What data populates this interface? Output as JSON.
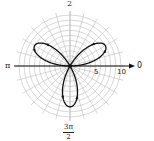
{
  "chart_data": {
    "type": "polar",
    "title": "",
    "equation_form": "rose curve with three petals",
    "petal_directions_rad": [
      "π/6",
      "5π/6",
      "3π/2"
    ],
    "petal_directions_deg": [
      30,
      150,
      270
    ],
    "petal_length": 8,
    "axis_labels": {
      "angle_0": "0",
      "angle_pi_over_2": "2",
      "angle_pi": "π",
      "angle_3pi_over_2": {
        "numerator": "3π",
        "denominator": "2"
      }
    },
    "radial_tick_labels": [
      "5",
      "10"
    ],
    "radial_range": [
      0,
      10
    ],
    "grid": {
      "rings": 10,
      "spoke_step_deg": 15,
      "on": true
    },
    "direction_arrows_on_curve": true
  },
  "labels": {
    "top": "2",
    "left": "π",
    "right": "0",
    "r5": "5",
    "r10": "10",
    "bottom_num": "3π",
    "bottom_den": "2"
  },
  "colors": {
    "grid": "#bdbdbd",
    "axis": "#111111",
    "curve": "#111111"
  }
}
